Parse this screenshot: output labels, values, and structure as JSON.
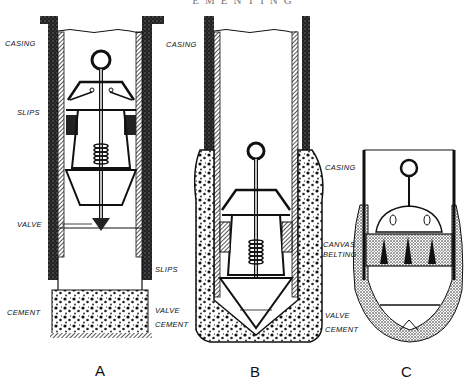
{
  "header": {
    "title_fragment": "EMENTING"
  },
  "figures": [
    {
      "id": "A",
      "caption": "A",
      "labels": {
        "casing": "CASING",
        "slips": "SLIPS",
        "valve": "VALVE",
        "cement": "CEMENT"
      }
    },
    {
      "id": "B",
      "caption": "B",
      "labels": {
        "casing": "CASING",
        "slips": "SLIPS",
        "valve": "VALVE",
        "cement": "CEMENT"
      }
    },
    {
      "id": "C",
      "caption": "C",
      "labels": {
        "casing": "CASING",
        "canvas": "CANVAS",
        "belting": "BELTING",
        "valve": "VALVE",
        "cement": "CEMENT"
      }
    }
  ],
  "colors": {
    "ink": "#111111",
    "background": "#ffffff"
  }
}
